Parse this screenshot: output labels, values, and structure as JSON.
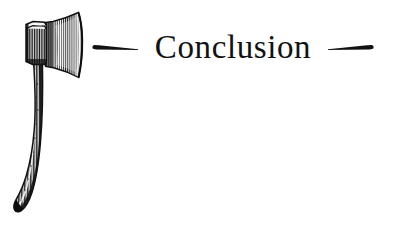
{
  "page": {
    "background_color": "#ffffff",
    "width": 393,
    "height": 226
  },
  "heading": {
    "title": "Conclusion",
    "text_color": "#121212",
    "ornament_color": "#111111",
    "left_ornament_name": "tapered-dash-left-ornament",
    "right_ornament_name": "tapered-dash-right-ornament"
  },
  "illustration": {
    "subject": "axe",
    "style": "vintage line engraving, black ink hatching",
    "ink_color": "#1a1a1a",
    "parts": {
      "poll": "poll-butt",
      "blade": "flared-blade",
      "handle": "curved-handle",
      "knob": "handle-end-knob"
    }
  }
}
